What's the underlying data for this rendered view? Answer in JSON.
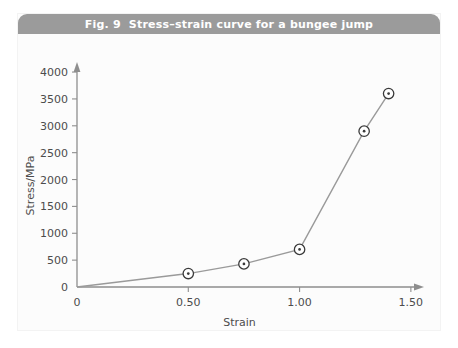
{
  "figure": {
    "title": "Fig. 9  Stress–strain curve for a bungee jump",
    "title_bar_color": "#9b9b9b",
    "title_text_color": "#ffffff",
    "background_color": "#ffffff",
    "panel_color": "#fcfcfc"
  },
  "chart_data": {
    "type": "line",
    "title": "Fig. 9  Stress–strain curve for a bungee jump",
    "xlabel": "Strain",
    "ylabel": "Stress/MPa",
    "xlim": [
      0,
      1.55
    ],
    "ylim": [
      0,
      4150
    ],
    "grid": false,
    "legend": null,
    "line_color": "#9a9a9a",
    "marker_color": "#3a3a3a",
    "marker_style": "circle-with-center-dot",
    "x": [
      0,
      0.5,
      0.75,
      1.0,
      1.29,
      1.4
    ],
    "y": [
      0,
      250,
      430,
      700,
      2900,
      3600
    ],
    "points": [
      {
        "x": 0,
        "y": 0,
        "marker": false
      },
      {
        "x": 0.5,
        "y": 250,
        "marker": true
      },
      {
        "x": 0.75,
        "y": 430,
        "marker": true
      },
      {
        "x": 1.0,
        "y": 700,
        "marker": true
      },
      {
        "x": 1.29,
        "y": 2900,
        "marker": true
      },
      {
        "x": 1.4,
        "y": 3600,
        "marker": true
      }
    ],
    "xticks": [
      0,
      0.5,
      1.0,
      1.5
    ],
    "xticklabels": [
      "0",
      "0.50",
      "1.00",
      "1.50"
    ],
    "yticks": [
      0,
      500,
      1000,
      1500,
      2000,
      2500,
      3000,
      3500,
      4000
    ],
    "yticklabels": [
      "0",
      "500",
      "1000",
      "1500",
      "2000",
      "2500",
      "3000",
      "3500",
      "4000"
    ]
  }
}
